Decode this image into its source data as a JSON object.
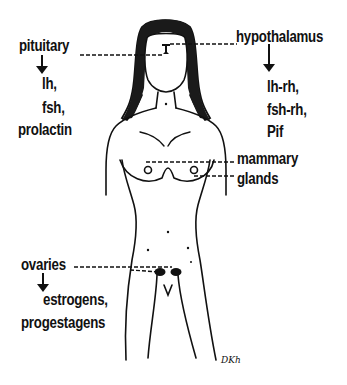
{
  "diagram": {
    "type": "anatomical-hormone-diagram",
    "colors": {
      "ink": "#111111",
      "background": "#ffffff"
    },
    "labels": {
      "pituitary": {
        "title": "pituitary",
        "hormones": [
          "lh,",
          "fsh,",
          "prolactin"
        ]
      },
      "hypothalamus": {
        "title": "hypothalamus",
        "hormones": [
          "lh-rh,",
          "fsh-rh,",
          "Pif"
        ]
      },
      "mammary": {
        "line1": "mammary",
        "line2": "glands"
      },
      "ovaries": {
        "title": "ovaries",
        "hormones": [
          "estrogens,",
          "progestagens"
        ]
      }
    },
    "signature": "DKh"
  }
}
